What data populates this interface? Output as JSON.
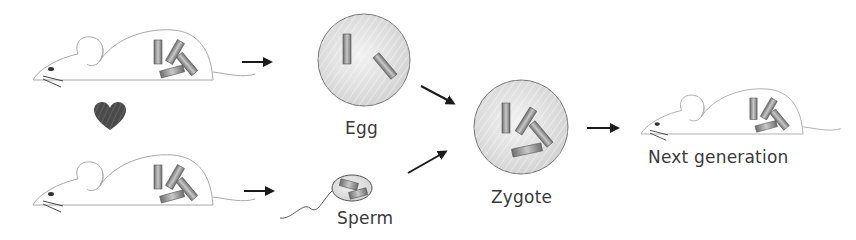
{
  "diagram": {
    "labels": {
      "egg": "Egg",
      "sperm": "Sperm",
      "zygote": "Zygote",
      "next_generation": "Next generation"
    },
    "nodes": [
      {
        "id": "parent-mouse-top",
        "type": "mouse",
        "chromosomes": 4
      },
      {
        "id": "heart",
        "type": "heart"
      },
      {
        "id": "parent-mouse-bottom",
        "type": "mouse",
        "chromosomes": 4
      },
      {
        "id": "egg",
        "type": "cell",
        "chromosomes": 2
      },
      {
        "id": "sperm",
        "type": "cell",
        "chromosomes": 2
      },
      {
        "id": "zygote",
        "type": "cell",
        "chromosomes": 4
      },
      {
        "id": "next-generation-mouse",
        "type": "mouse",
        "chromosomes": 4
      }
    ],
    "edges": [
      {
        "from": "parent-mouse-top",
        "to": "egg"
      },
      {
        "from": "parent-mouse-bottom",
        "to": "sperm"
      },
      {
        "from": "egg",
        "to": "zygote"
      },
      {
        "from": "sperm",
        "to": "zygote"
      },
      {
        "from": "zygote",
        "to": "next-generation-mouse"
      }
    ],
    "colors": {
      "outline": "#9a9a9a",
      "cell_fill": "#dcdcdc",
      "chromosome_light": "#c8c8c8",
      "chromosome_dark": "#6e6e6e",
      "heart": "#4a4a4a",
      "arrow": "#1a1a1a",
      "text": "#3a3a3a"
    }
  }
}
